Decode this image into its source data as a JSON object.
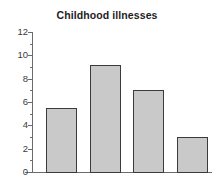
{
  "chart_data": {
    "type": "bar",
    "title": "Childhood illnesses",
    "xlabel": "",
    "ylabel": "",
    "categories": [
      "",
      "",
      "",
      ""
    ],
    "values": [
      5.5,
      9.2,
      7.0,
      3.0
    ],
    "ylim": [
      0,
      12
    ],
    "ytick_labels": [
      "12",
      "10",
      "8",
      "6",
      "4",
      "2",
      "0"
    ],
    "ytick_values": [
      12,
      10,
      8,
      6,
      4,
      2,
      0
    ],
    "minor_ytick_values": [
      11,
      9,
      7,
      5,
      3,
      1
    ],
    "grid": false,
    "legend": false,
    "legend_position": "none",
    "bar_fill_color": "#c9c9c9",
    "bar_border_color": "#3b3b3b",
    "axis_color": "#6b6b6b",
    "background_color": "#ffffff",
    "title_color": "#1d1d1d",
    "tick_label_color": "#3a3a3a"
  }
}
